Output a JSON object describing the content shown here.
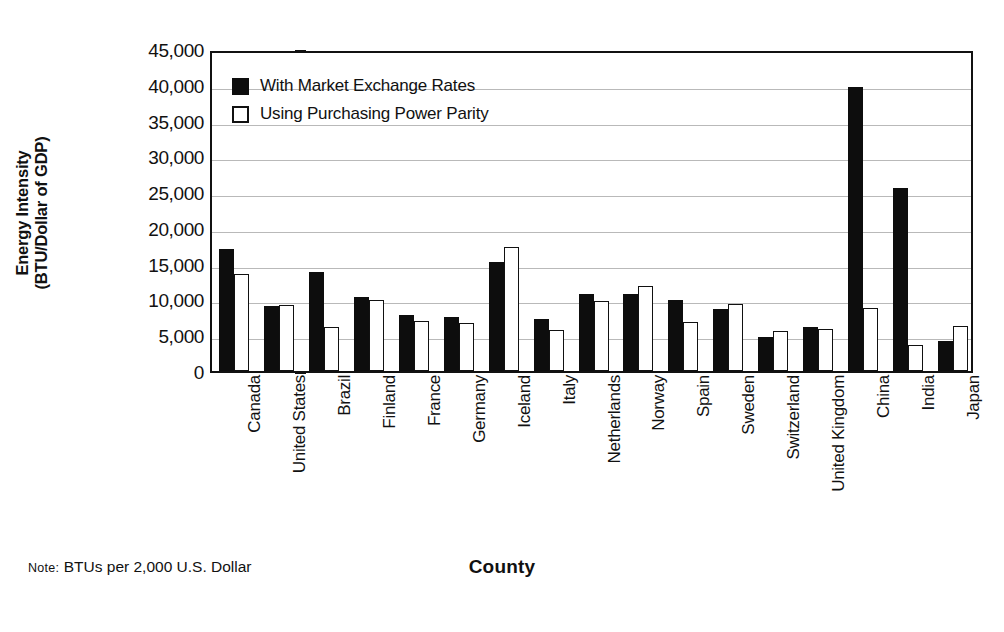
{
  "chart_data": {
    "type": "bar",
    "title": "",
    "xlabel": "County",
    "ylabel": "Energy Intensity\n(BTU/Dollar of GDP)",
    "ylim": [
      0,
      45000
    ],
    "ytick_values": [
      0,
      5000,
      10000,
      15000,
      20000,
      25000,
      30000,
      35000,
      40000,
      45000
    ],
    "ytick_labels": [
      "0",
      "5,000",
      "10,000",
      "15,000",
      "20,000",
      "25,000",
      "30,000",
      "35,000",
      "40,000",
      "45,000"
    ],
    "grid": true,
    "legend_position": "top-left",
    "categories": [
      "Canada",
      "United States",
      "Brazil",
      "Finland",
      "France",
      "Germany",
      "Iceland",
      "Italy",
      "Netherlands",
      "Norway",
      "Spain",
      "Sweden",
      "Switzerland",
      "United Kingdom",
      "China",
      "India",
      "Japan"
    ],
    "series": [
      {
        "name": "With Market Exchange Rates",
        "color": "#0d0d0d",
        "fill": "solid",
        "values": [
          17000,
          9100,
          13800,
          10400,
          7800,
          7600,
          15300,
          7200,
          10800,
          10700,
          9900,
          8700,
          4800,
          6100,
          39700,
          25600,
          4200
        ]
      },
      {
        "name": "Using Purchasing Power Parity",
        "color": "#ffffff",
        "fill": "outline",
        "values": [
          13500,
          9200,
          6100,
          9900,
          7000,
          6700,
          17400,
          5800,
          9800,
          11900,
          6800,
          9300,
          5600,
          5900,
          8800,
          3700,
          6300
        ]
      }
    ],
    "note": "BTUs per 2,000 U.S. Dollar",
    "note_keyword": "Note:"
  }
}
